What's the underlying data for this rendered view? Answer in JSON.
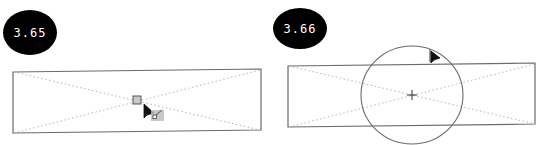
{
  "figures": [
    {
      "step_label": "3.65",
      "description": "Placeholder frame with center handle selected; cursor dragging from center"
    },
    {
      "step_label": "3.66",
      "description": "Circle drawn from center of placeholder frame; cursor at circle edge"
    }
  ],
  "colors": {
    "badge_bg": "#000000",
    "badge_text": "#ffffff",
    "frame_stroke": "#6b6b6b",
    "diagonal_stroke": "#b0b0b0",
    "circle_stroke": "#6b6b6b",
    "handle_fill": "#c8c8c8"
  }
}
